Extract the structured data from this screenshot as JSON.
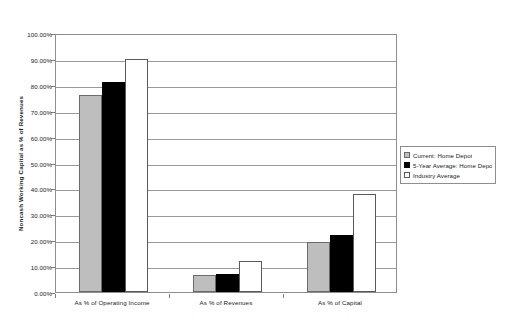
{
  "chart_data": {
    "type": "bar",
    "title": "",
    "xlabel": "",
    "ylabel": "Noncash Working Capital as % of Revenues",
    "ylim": [
      0,
      100
    ],
    "y_tick_labels": [
      "100.00%",
      "90.00%",
      "80.00%",
      "70.00%",
      "60.00%",
      "50.00%",
      "40.00%",
      "30.00%",
      "20.00%",
      "10.00%",
      "0.00%"
    ],
    "y_tick_values": [
      100,
      90,
      80,
      70,
      60,
      50,
      40,
      30,
      20,
      10,
      0
    ],
    "grid": true,
    "legend_position": "right",
    "categories": [
      "As % of Operating Income",
      "As % of Revenues",
      "As % of Capital"
    ],
    "series": [
      {
        "name": "Current: Home Depot",
        "color": "#bebebe",
        "values": [
          76.0,
          6.5,
          19.5
        ]
      },
      {
        "name": "5-Year Average: Home Depot",
        "color": "#000000",
        "values": [
          81.0,
          7.0,
          22.0
        ]
      },
      {
        "name": "Industry Average",
        "color": "#ffffff",
        "values": [
          90.0,
          12.0,
          38.0
        ]
      }
    ]
  }
}
